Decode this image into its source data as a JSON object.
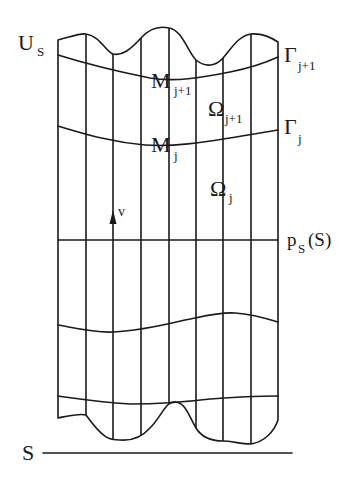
{
  "figure": {
    "labels": {
      "top_set": {
        "main": "U",
        "sub": "S"
      },
      "gamma_upper": {
        "main": "Γ",
        "sub": "j+1"
      },
      "gamma_lower": {
        "main": "Γ",
        "sub": "j"
      },
      "m_upper": {
        "main": "M",
        "sub": "j+1"
      },
      "m_lower": {
        "main": "M",
        "sub": "j"
      },
      "omega_upper": {
        "main": "Ω",
        "sub": "j+1"
      },
      "omega_lower": {
        "main": "Ω",
        "sub": "j"
      },
      "vector": "v",
      "projection": {
        "main": "p",
        "sub": "S",
        "arg": "(S)"
      },
      "base": "S"
    },
    "grid": {
      "vertical_lines_x": [
        58,
        86,
        113,
        141,
        169,
        196,
        223,
        251,
        278
      ],
      "horizontal_line_y": 240
    },
    "colors": {
      "ink": "#1a1a1a",
      "background": "#ffffff"
    }
  }
}
